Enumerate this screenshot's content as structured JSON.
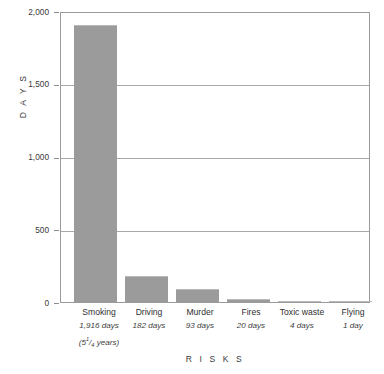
{
  "chart_data": {
    "type": "bar",
    "title": "",
    "xlabel": "R I S K S",
    "ylabel": "D A Y S",
    "ylim": [
      0,
      2000
    ],
    "yticks": [
      0,
      500,
      1000,
      1500,
      2000
    ],
    "ytick_labels": [
      "0",
      "500",
      "1,000",
      "1,500",
      "2,000"
    ],
    "grid": true,
    "legend": "none",
    "bar_color": "#9b9b9b",
    "categories": [
      "Smoking",
      "Driving",
      "Murder",
      "Fires",
      "Toxic waste",
      "Flying"
    ],
    "values": [
      1916,
      182,
      93,
      20,
      4,
      1
    ],
    "value_labels": [
      "1,916 days",
      "182 days",
      "93 days",
      "20 days",
      "4 days",
      "1 day"
    ],
    "annotations": [
      {
        "category": "Smoking",
        "text": "(5 1/4 years)",
        "whole": "(5",
        "numerator": "1",
        "denominator": "4",
        "suffix": " years)"
      }
    ]
  }
}
